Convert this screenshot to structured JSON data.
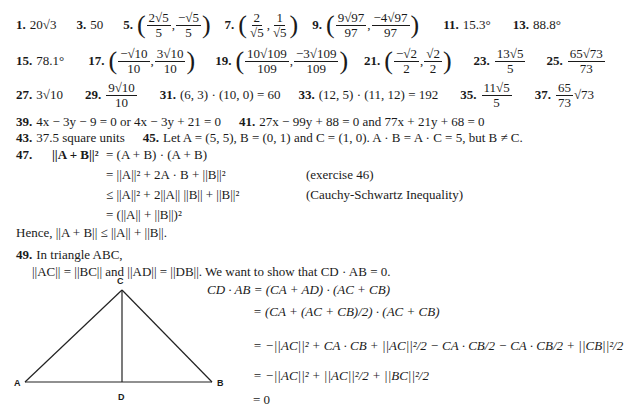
{
  "answers_row1": [
    {
      "num": "1.",
      "text": "20√3"
    },
    {
      "num": "3.",
      "text": "50"
    },
    {
      "num": "5.",
      "x": {
        "n": "2√5",
        "d": "5"
      },
      "y": {
        "n": "−√5",
        "d": "5"
      }
    },
    {
      "num": "7.",
      "x": {
        "n": "2",
        "d": "√5"
      },
      "y": {
        "n": "1",
        "d": "√5"
      }
    },
    {
      "num": "9.",
      "x": {
        "n": "9√97",
        "d": "97"
      },
      "y": {
        "n": "−4√97",
        "d": "97"
      }
    },
    {
      "num": "11.",
      "text": "15.3°"
    },
    {
      "num": "13.",
      "text": "88.8°"
    }
  ],
  "answers_row2": [
    {
      "num": "15.",
      "text": "78.1°"
    },
    {
      "num": "17.",
      "x": {
        "n": "−√10",
        "d": "10"
      },
      "y": {
        "n": "3√10",
        "d": "10"
      }
    },
    {
      "num": "19.",
      "x": {
        "n": "10√109",
        "d": "109"
      },
      "y": {
        "n": "−3√109",
        "d": "109"
      }
    },
    {
      "num": "21.",
      "x": {
        "n": "−√2",
        "d": "2"
      },
      "y": {
        "n": "√2",
        "d": "2"
      }
    },
    {
      "num": "23.",
      "frac": {
        "n": "13√5",
        "d": "5"
      }
    },
    {
      "num": "25.",
      "frac": {
        "n": "65√73",
        "d": "73"
      }
    }
  ],
  "answers_row3": [
    {
      "num": "27.",
      "text": "3√10"
    },
    {
      "num": "29.",
      "frac": {
        "n": "9√10",
        "d": "10"
      }
    },
    {
      "num": "31.",
      "text": "(6, 3) · (10, 0) = 60"
    },
    {
      "num": "33.",
      "text": "(12, 5) · (11, 12) = 192"
    },
    {
      "num": "35.",
      "frac": {
        "n": "11√5",
        "d": "5"
      }
    },
    {
      "num": "37.",
      "frac": {
        "n": "65",
        "d": "73"
      },
      "suffix": "√73"
    }
  ],
  "a39": {
    "num": "39.",
    "text": "4x − 3y − 9 = 0 or 4x − 3y + 21 = 0"
  },
  "a41": {
    "num": "41.",
    "text": "27x − 99y + 88 = 0 and 77x + 21y + 68 = 0"
  },
  "a43": {
    "num": "43.",
    "text": "37.5 square units"
  },
  "a45": {
    "num": "45.",
    "text": "Let A = (5, 5), B = (0, 1) and C = (1, 0). A · B = A · C = 5, but B ≠ C."
  },
  "a47": {
    "num": "47.",
    "lines": [
      {
        "lhs": "||A + B||²",
        "rhs": "= (A + B) · (A + B)",
        "note": ""
      },
      {
        "lhs": "",
        "rhs": "= ||A||² + 2A · B + ||B||²",
        "note": "(exercise 46)"
      },
      {
        "lhs": "",
        "rhs": "≤ ||A||² + 2||A|| ||B|| + ||B||²",
        "note": "(Cauchy-Schwartz Inequality)"
      },
      {
        "lhs": "",
        "rhs": "= (||A|| + ||B||)²",
        "note": ""
      }
    ],
    "conclusion": "Hence, ||A + B|| ≤ ||A|| + ||B||."
  },
  "a49": {
    "num": "49.",
    "intro": "In triangle ABC,",
    "given": "||AC|| = ||BC|| and ||AD|| = ||DB||. We want to show that CD · AB = 0.",
    "diagram_labels": {
      "A": "A",
      "B": "B",
      "C": "C",
      "D": "D"
    },
    "steps": [
      "CD · AB = (CA + AD) · (AC + CB)",
      "= (CA + (AC + CB)/2) · (AC + CB)",
      "= −||AC||² + CA · CB + ||AC||²/2 − CA · CB/2 − CA · CB/2 + ||CB||²/2",
      "= −||AC||² + ||AC||²/2 + ||BC||²/2",
      "= 0"
    ]
  }
}
